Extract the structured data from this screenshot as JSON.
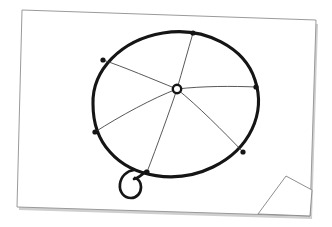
{
  "canvas": {
    "width": 332,
    "height": 227,
    "background_color": "#ffffff",
    "title": "Umbrella line drawing on a curled sheet of paper"
  },
  "paper": {
    "name": "paper-sheet",
    "fill_color": "#ffffff",
    "border_color": "#9a9a9a",
    "shadow_color": "#cfcfcf",
    "outline_points": "22,10 316,20 310,216 17,207",
    "curl": {
      "name": "page-curl",
      "label": "folded bottom-right corner",
      "fold_points": "310,216 258,214 286,176 312,190",
      "fold_fill": "#ffffff",
      "fold_border": "#8f8f8f"
    }
  },
  "drawing": {
    "name": "umbrella-sketch",
    "subject": "umbrella",
    "ink_color": "#151515",
    "rib_color": "#3a3a3a",
    "canopy": {
      "name": "umbrella-canopy",
      "stroke_width": 3.1,
      "center_x": 175,
      "center_y": 103,
      "radius_x": 83,
      "radius_y": 72,
      "path": "M 93 104 C 92 70 121 40 163 33 C 205 26 245 48 255 80 C 266 113 250 149 213 167 C 176 185 132 177 110 152 C 97 138 93 121 93 104 Z"
    },
    "hub": {
      "name": "umbrella-hub",
      "x": 177,
      "y": 89,
      "radius": 4.2,
      "label": "center ferrule"
    },
    "rim_points": [
      {
        "name": "rim-point-top",
        "x": 193,
        "y": 33
      },
      {
        "name": "rim-point-upper-right",
        "x": 256,
        "y": 87
      },
      {
        "name": "rim-point-lower-right",
        "x": 243,
        "y": 152
      },
      {
        "name": "rim-point-bottom",
        "x": 147,
        "y": 172
      },
      {
        "name": "rim-point-lower-left",
        "x": 95,
        "y": 132
      },
      {
        "name": "rim-point-upper-left",
        "x": 103,
        "y": 60
      }
    ],
    "ribs": [
      {
        "name": "rib-top",
        "path": "M 177 89 C 182 72 188 50 193 33"
      },
      {
        "name": "rib-upper-right",
        "path": "M 177 89 C 203 86 232 86 256 87"
      },
      {
        "name": "rib-lower-right",
        "path": "M 177 89 C 198 106 223 131 243 152"
      },
      {
        "name": "rib-bottom",
        "path": "M 177 89 C 169 113 157 146 147 172"
      },
      {
        "name": "rib-lower-left",
        "path": "M 177 89 C 153 98 120 116 95 132"
      },
      {
        "name": "rib-upper-left",
        "path": "M 177 89 C 152 79 124 67 103 60"
      }
    ],
    "handle": {
      "name": "umbrella-handle",
      "stroke_width": 2.7,
      "shaft_path": "M 146 171 C 142 175 138 178 134 179",
      "hook_path": "M 134 170 C 127 171 121 176 120 184 C 119 192 124 198 131 198 C 137 198 141 193 141 187 C 141 182 138 179 135 178"
    },
    "rib_stroke_width": 0.85
  }
}
